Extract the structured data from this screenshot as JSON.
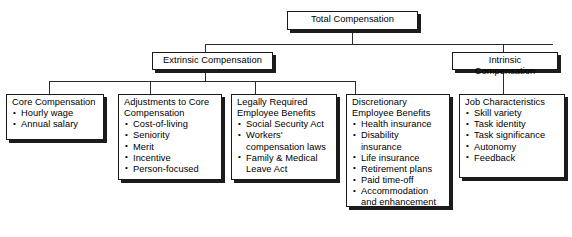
{
  "diagram": {
    "root": {
      "label": "Total Compensation"
    },
    "level2": [
      {
        "label": "Extrinsic Compensation"
      },
      {
        "label": "Intrinsic Compensation"
      }
    ],
    "level3": [
      {
        "header": "Core Compensation",
        "items": [
          "Hourly wage",
          "Annual salary"
        ]
      },
      {
        "header": "Adjustments to Core\nCompensation",
        "items": [
          "Cost-of-living",
          "Seniority",
          "Merit",
          "Incentive",
          "Person-focused"
        ]
      },
      {
        "header": "Legally Required\nEmployee Benefits",
        "items": [
          "Social Security Act",
          "Workers'\ncompensation laws",
          "Family & Medical\nLeave Act"
        ]
      },
      {
        "header": "Discretionary\nEmployee Benefits",
        "items": [
          "Health insurance",
          "Disability\ninsurance",
          "Life insurance",
          "Retirement plans",
          "Paid time-off",
          "Accommodation\nand enhancement"
        ]
      },
      {
        "header": "Job Characteristics",
        "items": [
          "Skill variety",
          "Task identity",
          "Task significance",
          "Autonomy",
          "Feedback"
        ]
      }
    ],
    "colors": {
      "box_border": "#1a1a1a",
      "box_fill": "#ffffff",
      "shadow": "#1c1c1c",
      "line": "#2a2a2a",
      "text": "#000000"
    }
  }
}
